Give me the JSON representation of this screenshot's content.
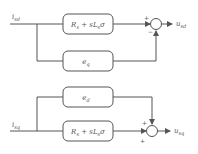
{
  "diagram": {
    "type": "block-diagram",
    "inputs": {
      "top": {
        "label": "i",
        "sub": "sd"
      },
      "bottom": {
        "label": "i",
        "sub": "sq"
      }
    },
    "outputs": {
      "top": {
        "label": "u",
        "sub": "sd"
      },
      "bottom": {
        "label": "u",
        "sub": "sq"
      }
    },
    "blocks": {
      "top_impedance": {
        "main": "R",
        "sub1": "s",
        "mid": " + s",
        "L": "L",
        "sub2": "s",
        "tail": "σ"
      },
      "eq": {
        "main": "e",
        "sub": "q"
      },
      "ed": {
        "main": "e",
        "sub": "d"
      },
      "bottom_impedance": {
        "main": "R",
        "sub1": "s",
        "mid": " + s",
        "L": "L",
        "sub2": "s",
        "tail": "σ"
      }
    },
    "summers": {
      "top": {
        "left_sign": "+",
        "bottom_sign": "−"
      },
      "bottom": {
        "top_sign": "+",
        "left_sign": "+"
      }
    },
    "colors": {
      "line": "#555555",
      "text": "#555555",
      "background": "#ffffff"
    }
  }
}
